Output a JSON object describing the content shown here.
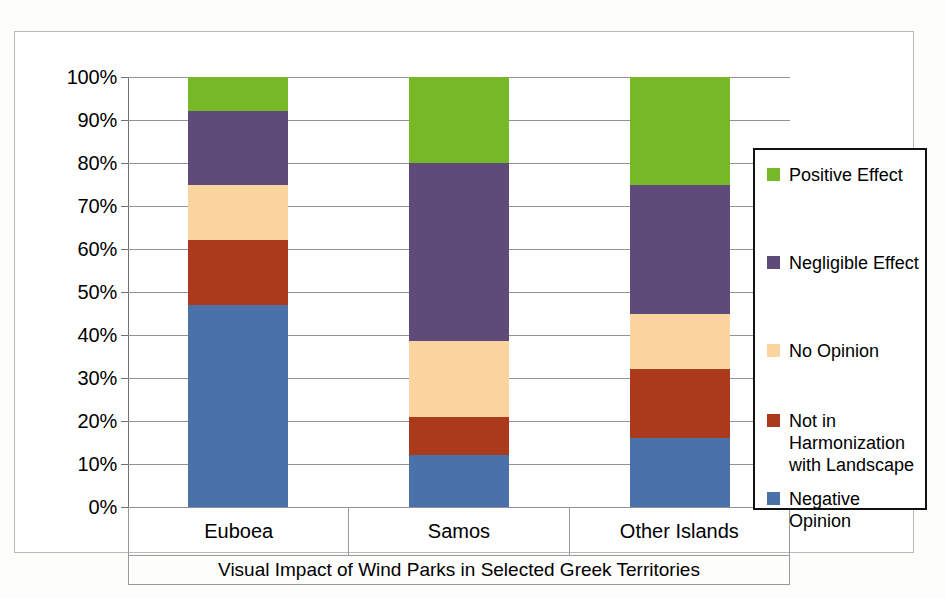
{
  "chart_data": {
    "type": "bar",
    "subtype": "stacked-100-percent",
    "title": "Visual Impact of Wind Parks in Selected Greek Territories",
    "xlabel": "",
    "ylabel": "",
    "ylim": [
      0,
      100
    ],
    "grid": true,
    "legend_position": "right-inside",
    "categories": [
      "Euboea",
      "Samos",
      "Other Islands"
    ],
    "ytick_labels": [
      "0%",
      "10%",
      "20%",
      "30%",
      "40%",
      "50%",
      "60%",
      "70%",
      "80%",
      "90%",
      "100%"
    ],
    "ytick_values": [
      0,
      10,
      20,
      30,
      40,
      50,
      60,
      70,
      80,
      90,
      100
    ],
    "series": [
      {
        "name": "Negative Opinion",
        "color": "#4a72a8",
        "values": [
          47,
          12,
          16
        ]
      },
      {
        "name": "Not in Harmonization with Landscape",
        "color": "#ab3a1c",
        "values": [
          15,
          9,
          16
        ]
      },
      {
        "name": "No Opinion",
        "color": "#fbd4a0",
        "values": [
          13,
          17.5,
          13
        ]
      },
      {
        "name": "Negligible Effect",
        "color": "#5e4b79",
        "values": [
          17,
          41.5,
          30
        ]
      },
      {
        "name": "Positive Effect",
        "color": "#76b828",
        "values": [
          8,
          20,
          25
        ]
      }
    ],
    "stack_order_bottom_to_top": [
      "Negative Opinion",
      "Not in Harmonization with Landscape",
      "No Opinion",
      "Negligible Effect",
      "Positive Effect"
    ],
    "cumulative_tops": {
      "Euboea": [
        47,
        62,
        75,
        92,
        100
      ],
      "Samos": [
        12,
        21,
        38.5,
        80,
        100
      ],
      "Other Islands": [
        16,
        32,
        45,
        75,
        100
      ]
    }
  },
  "legend": {
    "entries": [
      {
        "label": "Positive Effect",
        "color": "#76b828"
      },
      {
        "label": "Negligible Effect",
        "color": "#5e4b79"
      },
      {
        "label": "No Opinion",
        "color": "#fbd4a0"
      },
      {
        "label": "Not in\nHarmonization\nwith Landscape",
        "color": "#ab3a1c"
      },
      {
        "label": "Negative\nOpinion",
        "color": "#4a72a8"
      }
    ]
  }
}
